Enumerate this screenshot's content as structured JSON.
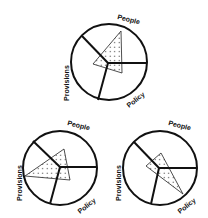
{
  "diagram": {
    "type": "three-sector circle diagrams with overlaid dotted triangles",
    "sectors": [
      "People",
      "Policy",
      "Provisions"
    ],
    "colors": {
      "line": "#111111",
      "background": "#ffffff",
      "dots": "#333333"
    },
    "panels": [
      {
        "id": "top",
        "labels": {
          "people": "People",
          "policy": "Policy",
          "provisions": "Provisions"
        },
        "triangle_emphasis": "People"
      },
      {
        "id": "bottom-left",
        "labels": {
          "people": "People",
          "policy": "Policy",
          "provisions": "Provisions"
        },
        "triangle_emphasis": "Provisions"
      },
      {
        "id": "bottom-right",
        "labels": {
          "people": "People",
          "policy": "Policy",
          "provisions": "Provisions"
        },
        "triangle_emphasis": "Policy"
      }
    ]
  }
}
